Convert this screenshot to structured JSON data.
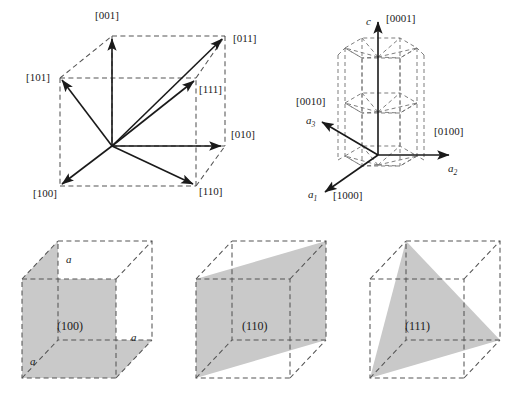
{
  "figure": {
    "colors": {
      "plane_fill": "#c9c9c9",
      "dashed_edge": "#555555",
      "arrow": "#1a1a1a",
      "background": "#ffffff"
    }
  },
  "cubic_directions": {
    "name": "cubic-direction-diagram",
    "labels": {
      "d001": "[001]",
      "d011": "[011]",
      "d101": "[101]",
      "d111": "[111]",
      "d010": "[010]",
      "d100": "[100]",
      "d110": "[110]"
    }
  },
  "hexagonal_directions": {
    "name": "hexagonal-direction-diagram",
    "labels": {
      "axis_c": "c",
      "d0001": "[0001]",
      "d0010": "[0010]",
      "d0100": "[0100]",
      "d1000": "[1000]",
      "axis_a1": "a",
      "axis_a1_sub": "1",
      "axis_a2": "a",
      "axis_a2_sub": "2",
      "axis_a3": "a",
      "axis_a3_sub": "3"
    }
  },
  "planes": [
    {
      "name": "plane-100",
      "label": "(100)",
      "edge_labels": [
        "a",
        "a",
        "a"
      ]
    },
    {
      "name": "plane-110",
      "label": "(110)",
      "edge_labels": []
    },
    {
      "name": "plane-111",
      "label": "(111)",
      "edge_labels": []
    }
  ]
}
